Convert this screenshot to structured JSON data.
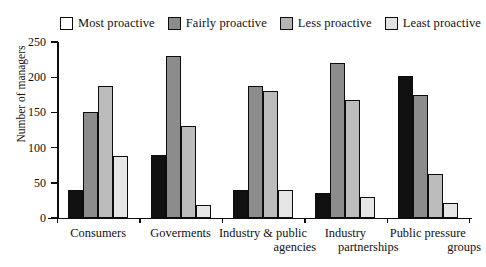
{
  "chart_data": {
    "type": "bar",
    "title": "",
    "subtitle": "",
    "xlabel": "",
    "ylabel": "Number of managers",
    "ylim": [
      0,
      250
    ],
    "yticks": [
      0,
      50,
      100,
      150,
      200,
      250
    ],
    "grid": false,
    "legend_position": "top",
    "orientation": "vertical",
    "grouping": "clustered",
    "categories": [
      "Consumers",
      "Goverments",
      "Industry & public agencies",
      "Industry partnerships",
      "Public pressure groups"
    ],
    "series": [
      {
        "name": "Most proactive",
        "color": "#111111",
        "legend_color": "#ffffff",
        "values": [
          40,
          90,
          40,
          35,
          202
        ]
      },
      {
        "name": "Fairly proactive",
        "color": "#8c8c8c",
        "legend_color": "#8c8c8c",
        "values": [
          151,
          230,
          188,
          220,
          175
        ]
      },
      {
        "name": "Less proactive",
        "color": "#bcbcbc",
        "legend_color": "#b4b4b4",
        "values": [
          188,
          130,
          180,
          168,
          62
        ]
      },
      {
        "name": "Least proactive",
        "color": "#e6e6e6",
        "legend_color": "#e2e2e2",
        "values": [
          88,
          18,
          40,
          30,
          22
        ]
      }
    ]
  },
  "legend": {
    "items": [
      {
        "label": "Most proactive"
      },
      {
        "label": "Fairly proactive"
      },
      {
        "label": "Less proactive"
      },
      {
        "label": "Least proactive"
      }
    ]
  },
  "axes": {
    "y_title": "Number of managers",
    "y_tick_labels": [
      "250",
      "200",
      "150",
      "100",
      "50",
      "0"
    ],
    "x_tick_labels": [
      [
        "Consumers"
      ],
      [
        "Goverments"
      ],
      [
        "Industry & public",
        "agencies"
      ],
      [
        "Industry",
        "partnerships"
      ],
      [
        "Public pressure",
        "groups"
      ]
    ]
  }
}
